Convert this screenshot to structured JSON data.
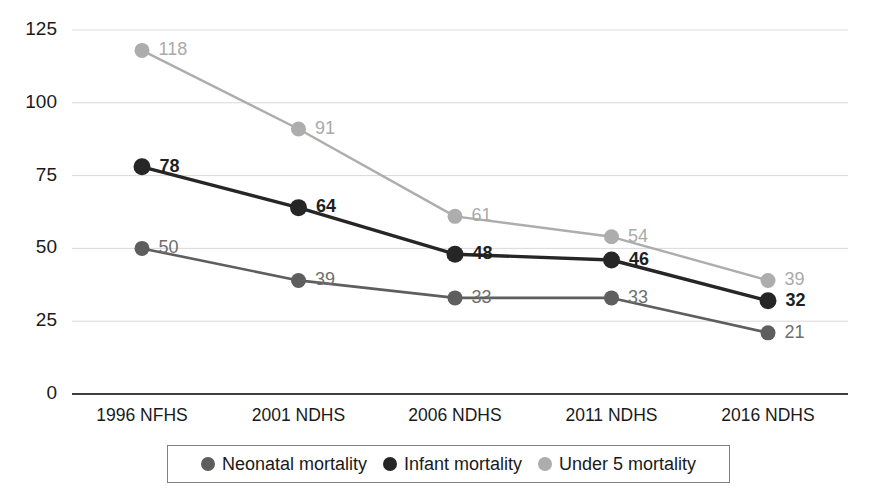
{
  "chart_data": {
    "type": "line",
    "title": "",
    "xlabel": "",
    "ylabel": "",
    "categories": [
      "1996 NFHS",
      "2001 NDHS",
      "2006 NDHS",
      "2011 NDHS",
      "2016 NDHS"
    ],
    "ylim": [
      0,
      125
    ],
    "yticks": [
      0,
      25,
      50,
      75,
      100,
      125
    ],
    "grid": true,
    "legend_position": "bottom",
    "series": [
      {
        "name": "Neonatal mortality",
        "values": [
          50,
          39,
          33,
          33,
          21
        ],
        "color": "#5e5e5e",
        "label_color": "#6e6e6e"
      },
      {
        "name": "Infant mortality",
        "values": [
          78,
          64,
          48,
          46,
          32
        ],
        "color": "#262626",
        "label_color": "#1f1f1f"
      },
      {
        "name": "Under 5 mortality",
        "values": [
          118,
          91,
          61,
          54,
          39
        ],
        "color": "#adadad",
        "label_color": "#aaaaaa"
      }
    ]
  },
  "axes": {
    "ytick_labels": [
      "125",
      "100",
      "75",
      "50",
      "25",
      "0"
    ],
    "xtick_labels": [
      "1996 NFHS",
      "2001 NDHS",
      "2006 NDHS",
      "2011 NDHS",
      "2016 NDHS"
    ]
  },
  "legend": {
    "items": [
      {
        "label": "Neonatal mortality",
        "color": "#5e5e5e",
        "marker": "circle-marker"
      },
      {
        "label": "Infant mortality",
        "color": "#262626",
        "marker": "circle-marker"
      },
      {
        "label": "Under 5 mortality",
        "color": "#adadad",
        "marker": "circle-marker"
      }
    ]
  }
}
